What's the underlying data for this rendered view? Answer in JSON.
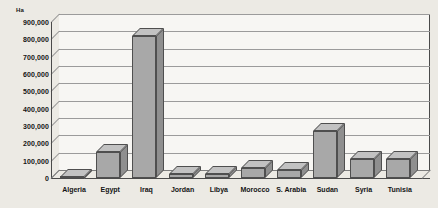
{
  "chart_data": {
    "type": "bar",
    "title": "",
    "xlabel": "",
    "ylabel": "Ha",
    "unit_label": "Ha",
    "categories": [
      "Algeria",
      "Egypt",
      "Iraq",
      "Jordan",
      "Libya",
      "Morocco",
      "S. Arabia",
      "Sudan",
      "Syria",
      "Tunisia"
    ],
    "values": [
      5000,
      150000,
      820000,
      25000,
      25000,
      60000,
      45000,
      270000,
      110000,
      110000
    ],
    "ylim": [
      0,
      900000
    ],
    "ytick_values": [
      0,
      100000,
      200000,
      300000,
      400000,
      500000,
      600000,
      700000,
      800000,
      900000
    ],
    "ytick_labels": [
      "0",
      "100,000",
      "200,000",
      "300,000",
      "400,000",
      "500,000",
      "600,000",
      "700,000",
      "800,000",
      "900,000"
    ],
    "grid": true,
    "legend": "none",
    "style": "3d-column",
    "colors": {
      "background": "#eceae4",
      "plot_background": "#f7f6f3",
      "bar_front": "#a8a8a8",
      "bar_top": "#c2c2c2",
      "bar_side": "#8f8f8f",
      "bar_outline": "#4f4f4f",
      "gridline": "#9b9b9b",
      "axis": "#4a4a4a",
      "text": "#141414"
    }
  }
}
